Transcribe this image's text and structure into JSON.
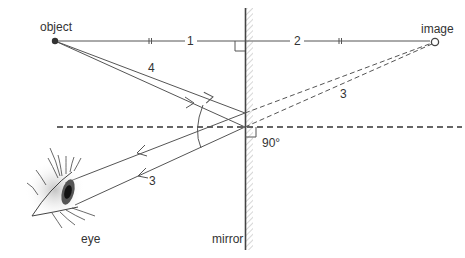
{
  "diagram": {
    "labels": {
      "object": "object",
      "image": "image",
      "eye": "eye",
      "mirror": "mirror",
      "angle": "90°"
    },
    "distance_labels": {
      "object_to_mirror": "1",
      "mirror_to_image": "2"
    },
    "ray_labels": {
      "incident_ray": "4",
      "virtual_ray": "3",
      "reflected_ray": "3"
    },
    "colors": {
      "line": "#555555",
      "hatch": "#bbbbbb",
      "text": "#333333",
      "iris": "#222222"
    }
  }
}
